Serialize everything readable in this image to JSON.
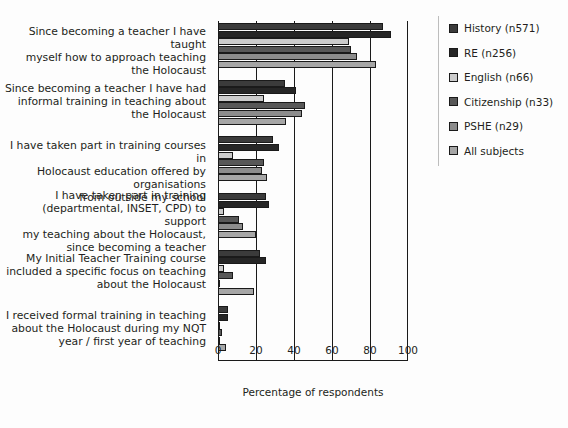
{
  "chart_data": {
    "type": "bar",
    "orientation": "horizontal",
    "title": "",
    "xlabel": "Percentage of respondents",
    "ylabel": "",
    "xlim": [
      0,
      100
    ],
    "xticks": [
      0,
      20,
      40,
      60,
      80,
      100
    ],
    "grid": true,
    "legend_position": "right",
    "categories": [
      "Since becoming a teacher I have taught myself how to approach teaching the Holocaust",
      "Since becoming a teacher I have had informal training in teaching about the Holocaust",
      "I have taken part in training courses in Holocaust education offered by organisations from outside my school",
      "I have taken part in training (departmental, INSET, CPD) to support my teaching about the Holocaust, since becoming a teacher",
      "My Initial Teacher Training course included a specific focus on teaching about the Holocaust",
      "I received formal training in teaching about the Holocaust during my NQT year / first year of teaching"
    ],
    "category_lines": [
      [
        "Since becoming a teacher I have taught",
        "myself how to approach teaching",
        "the Holocaust"
      ],
      [
        "Since becoming a teacher I have had",
        "informal training in teaching about",
        "the Holocaust"
      ],
      [
        "I have taken part in training courses in",
        "Holocaust education offered by organisations",
        "from outside my school"
      ],
      [
        "I have taken part in training",
        "(departmental, INSET, CPD) to support",
        "my teaching about the Holocaust,",
        "since becoming a teacher"
      ],
      [
        "My Initial Teacher Training course",
        "included a specific focus on teaching",
        "about the Holocaust"
      ],
      [
        "I received formal training in teaching",
        "about the Holocaust during my NQT",
        "year / first year of teaching"
      ]
    ],
    "series": [
      {
        "name": "History (n571)",
        "color": "#3b3b3b",
        "values": [
          87,
          35,
          29,
          25,
          22,
          5
        ]
      },
      {
        "name": "RE (n256)",
        "color": "#262626",
        "values": [
          91,
          41,
          32,
          27,
          25,
          5
        ]
      },
      {
        "name": "English (n66)",
        "color": "#cccccc",
        "values": [
          69,
          24,
          8,
          3,
          3,
          1
        ]
      },
      {
        "name": "Citizenship (n33)",
        "color": "#585858",
        "values": [
          70,
          46,
          24,
          11,
          8,
          2
        ]
      },
      {
        "name": "PSHE (n29)",
        "color": "#8c8c8c",
        "values": [
          73,
          44,
          23,
          13,
          1,
          1
        ]
      },
      {
        "name": "All subjects",
        "color": "#a6a6a6",
        "values": [
          83,
          36,
          26,
          20,
          19,
          4
        ]
      }
    ]
  },
  "axis": {
    "xlabel": "Percentage of respondents",
    "tick_labels": [
      "0",
      "20",
      "40",
      "60",
      "80",
      "100"
    ]
  },
  "legend": {
    "items": [
      {
        "label": "History (n571)",
        "color": "#3b3b3b"
      },
      {
        "label": "RE (n256)",
        "color": "#262626"
      },
      {
        "label": "English (n66)",
        "color": "#cccccc"
      },
      {
        "label": "Citizenship (n33)",
        "color": "#585858"
      },
      {
        "label": "PSHE (n29)",
        "color": "#8c8c8c"
      },
      {
        "label": "All subjects",
        "color": "#a6a6a6"
      }
    ]
  }
}
